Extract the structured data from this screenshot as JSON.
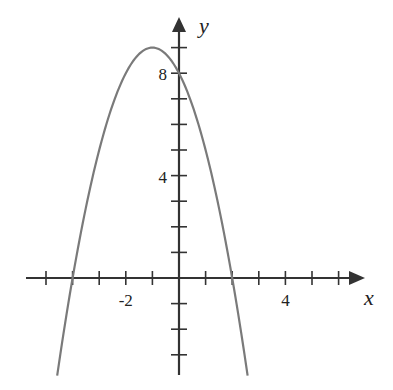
{
  "chart_data": {
    "type": "line",
    "title": "",
    "xlabel": "x",
    "ylabel": "y",
    "function": "y = -(x+4)(x-2) = -x^2 - 2x + 8",
    "x_ticks": [
      -5,
      -4,
      -3,
      -2,
      -1,
      1,
      2,
      3,
      4,
      5,
      6
    ],
    "y_ticks": [
      -3,
      -2,
      -1,
      1,
      2,
      3,
      4,
      5,
      6,
      7,
      8,
      9
    ],
    "x_tick_labels": [
      {
        "value": -2,
        "label": "-2"
      },
      {
        "value": 4,
        "label": "4"
      }
    ],
    "y_tick_labels": [
      {
        "value": 4,
        "label": "4"
      },
      {
        "value": 8,
        "label": "8"
      }
    ],
    "xlim": [
      -5.8,
      6.8
    ],
    "ylim": [
      -3.8,
      9.8
    ],
    "grid": false,
    "legend": null,
    "series": [
      {
        "name": "parabola",
        "color": "#7a7a7a",
        "x": [
          -4.58,
          -4,
          -3,
          -2,
          -1,
          0,
          1,
          2,
          2.58
        ],
        "y": [
          -3.8,
          0,
          5,
          8,
          9,
          8,
          5,
          0,
          -3.8
        ]
      }
    ],
    "key_points": {
      "vertex": [
        -1,
        9
      ],
      "roots": [
        -4,
        2
      ],
      "y_intercept": 8
    }
  },
  "colors": {
    "axis": "#333333",
    "curve": "#7a7a7a"
  }
}
